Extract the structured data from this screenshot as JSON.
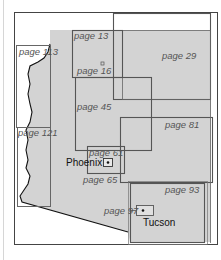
{
  "map": {
    "title": "Arizona regional page index map",
    "colors": {
      "state_fill": "#d3d3d3",
      "region_outline": "#555555",
      "frame_outline": "#444444",
      "label_text": "#555555",
      "city_text": "#111111"
    },
    "regions": [
      {
        "label": "page 13",
        "x": 72,
        "y": 30,
        "w": 50,
        "h": 47
      },
      {
        "label": "page 16",
        "x": 76,
        "y": 70,
        "w": 0,
        "h": 0
      },
      {
        "label": "page 29",
        "x": 113,
        "y": 13,
        "w": 98,
        "h": 86
      },
      {
        "label": "page 45",
        "x": 75,
        "y": 77,
        "w": 76,
        "h": 73
      },
      {
        "label": "page 61",
        "x": 87,
        "y": 146,
        "w": 37,
        "h": 27
      },
      {
        "label": "page 65",
        "x": 87,
        "y": 146,
        "w": 37,
        "h": 27
      },
      {
        "label": "page 81",
        "x": 120,
        "y": 117,
        "w": 93,
        "h": 65
      },
      {
        "label": "page 93",
        "x": 130,
        "y": 183,
        "w": 74,
        "h": 60
      },
      {
        "label": "page 97",
        "x": 136,
        "y": 205,
        "w": 17,
        "h": 10
      },
      {
        "label": "page 113",
        "x": 16,
        "y": 45,
        "w": 34,
        "h": 82
      },
      {
        "label": "page 121",
        "x": 17,
        "y": 127,
        "w": 34,
        "h": 79
      }
    ],
    "cities": [
      {
        "name": "Phoenix",
        "x": 107,
        "y": 162
      },
      {
        "name": "Tucson",
        "x": 144,
        "y": 210
      }
    ]
  }
}
